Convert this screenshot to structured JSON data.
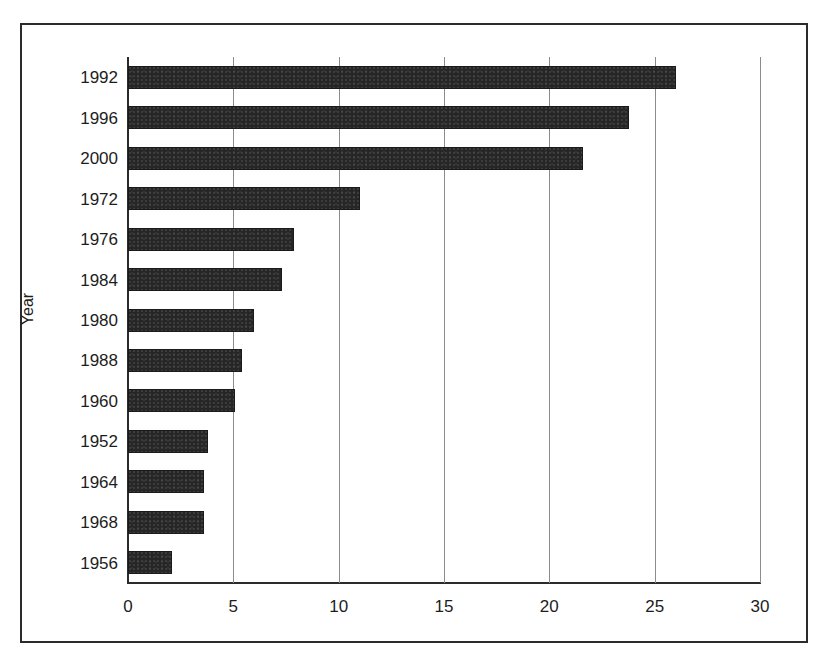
{
  "chart_data": {
    "type": "bar",
    "orientation": "horizontal",
    "title": "",
    "xlabel": "",
    "ylabel": "Year",
    "categories": [
      "1992",
      "1996",
      "2000",
      "1972",
      "1976",
      "1984",
      "1980",
      "1988",
      "1960",
      "1952",
      "1964",
      "1968",
      "1956"
    ],
    "values": [
      26.0,
      23.8,
      21.6,
      11.0,
      7.9,
      7.3,
      6.0,
      5.4,
      5.1,
      3.8,
      3.6,
      3.6,
      2.1
    ],
    "xlim": [
      0,
      30
    ],
    "xticks": [
      0,
      5,
      10,
      15,
      20,
      25,
      30
    ],
    "xtick_labels": [
      "0",
      "5",
      "10",
      "15",
      "20",
      "25",
      "30"
    ],
    "grid": "vertical",
    "legend": "none",
    "bar_color": "#262626",
    "gridline_color": "#8c8c8c",
    "axis_color": "#2b2b2b",
    "background_color": "#ffffff"
  }
}
